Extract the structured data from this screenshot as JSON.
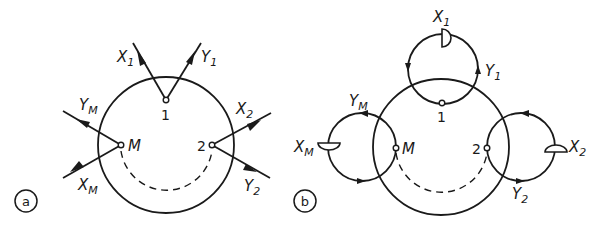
{
  "diagram_a": {
    "tag": "a",
    "nodes": {
      "n1": "1",
      "n2": "2",
      "nM": "M"
    },
    "labels": {
      "X1": {
        "base": "X",
        "sub": "1"
      },
      "Y1": {
        "base": "Y",
        "sub": "1"
      },
      "X2": {
        "base": "X",
        "sub": "2"
      },
      "Y2": {
        "base": "Y",
        "sub": "2"
      },
      "XM": {
        "base": "X",
        "sub": "M"
      },
      "YM": {
        "base": "Y",
        "sub": "M"
      }
    }
  },
  "diagram_b": {
    "tag": "b",
    "nodes": {
      "n1": "1",
      "n2": "2",
      "nM": "M"
    },
    "labels": {
      "X1": {
        "base": "X",
        "sub": "1"
      },
      "Y1": {
        "base": "Y",
        "sub": "1"
      },
      "X2": {
        "base": "X",
        "sub": "2"
      },
      "Y2": {
        "base": "Y",
        "sub": "2"
      },
      "XM": {
        "base": "X",
        "sub": "M"
      },
      "YM": {
        "base": "Y",
        "sub": "M"
      }
    }
  },
  "colors": {
    "ink": "#1a1a1a",
    "background": "#ffffff"
  }
}
